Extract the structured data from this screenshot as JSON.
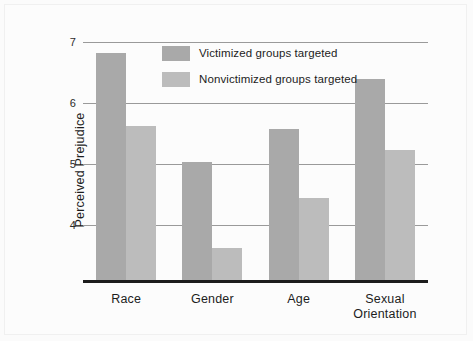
{
  "chart_data": {
    "type": "bar",
    "title": "",
    "subtitle": "",
    "xlabel": "",
    "ylabel": "Perceived Prejudice",
    "categories": [
      "Race",
      "Gender",
      "Age",
      "Sexual\nOrientation"
    ],
    "series": [
      {
        "name": "Victimized groups targeted",
        "color": "#a9a9a9",
        "values": [
          6.82,
          5.03,
          5.58,
          6.4
        ]
      },
      {
        "name": "Nonvictimized groups targeted",
        "color": "#bcbcbc",
        "values": [
          5.62,
          3.62,
          4.45,
          5.23
        ]
      }
    ],
    "yticks": [
      4,
      5,
      6,
      7
    ],
    "ytick_labels": [
      "4",
      "5",
      "6",
      "7"
    ],
    "ylim": [
      3.05,
      7.2
    ],
    "grid": true,
    "legend_position": "top-center-inside",
    "axis_baseline_color": "#1c1c1c",
    "gridline_color": "#9a9a9a",
    "background_color": "#fcfcfc"
  }
}
